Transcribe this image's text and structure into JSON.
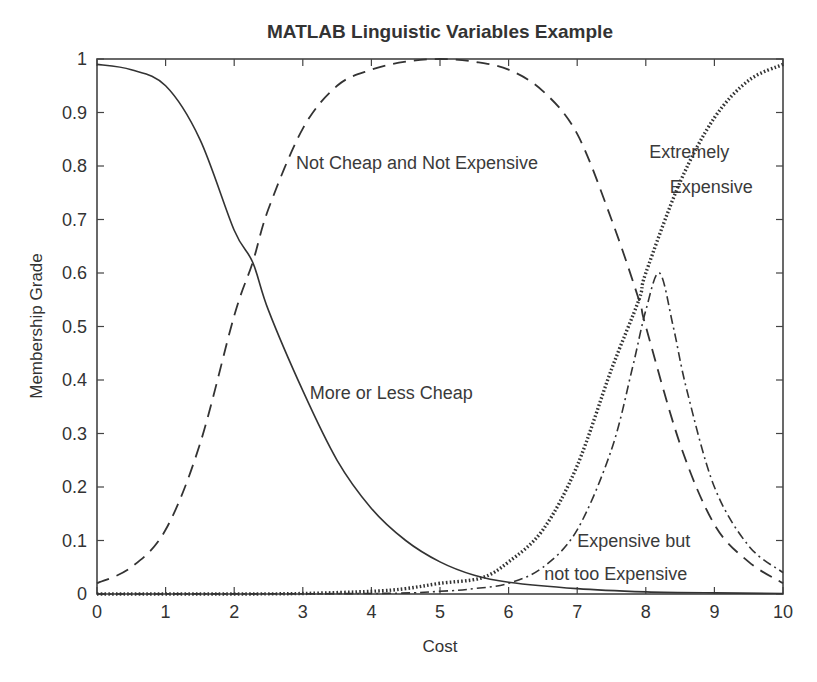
{
  "chart_data": {
    "type": "line",
    "title": "MATLAB Linguistic Variables Example",
    "xlabel": "Cost",
    "ylabel": "Membership Grade",
    "xlim": [
      0,
      10
    ],
    "ylim": [
      0,
      1
    ],
    "grid": false,
    "legend": "none (inline annotations)",
    "x_ticks": [
      0,
      1,
      2,
      3,
      4,
      5,
      6,
      7,
      8,
      9,
      10
    ],
    "x_tick_labels": [
      "0",
      "1",
      "2",
      "3",
      "4",
      "5",
      "6",
      "7",
      "8",
      "9",
      "10"
    ],
    "y_ticks": [
      0,
      0.1,
      0.2,
      0.3,
      0.4,
      0.5,
      0.6,
      0.7,
      0.8,
      0.9,
      1
    ],
    "y_tick_labels": [
      "0",
      "0.1",
      "0.2",
      "0.3",
      "0.4",
      "0.5",
      "0.6",
      "0.7",
      "0.8",
      "0.9",
      "1"
    ],
    "series": [
      {
        "name": "More or Less Cheap",
        "style": "solid",
        "x": [
          0,
          0.5,
          1,
          1.5,
          2,
          2.27,
          2.5,
          3,
          3.5,
          4,
          4.5,
          5,
          5.5,
          6,
          7,
          8,
          9,
          10
        ],
        "values": [
          0.99,
          0.98,
          0.95,
          0.85,
          0.68,
          0.62,
          0.53,
          0.38,
          0.25,
          0.16,
          0.1,
          0.06,
          0.035,
          0.022,
          0.01,
          0.004,
          0.002,
          0.001
        ]
      },
      {
        "name": "Not Cheap and Not Expensive",
        "style": "dashed",
        "x": [
          0,
          0.5,
          1,
          1.5,
          2,
          2.27,
          2.5,
          3,
          3.5,
          4,
          4.5,
          5,
          5.5,
          6,
          6.5,
          7,
          7.5,
          7.9,
          8,
          8.5,
          9,
          9.5,
          10
        ],
        "values": [
          0.02,
          0.05,
          0.12,
          0.28,
          0.52,
          0.62,
          0.72,
          0.87,
          0.95,
          0.98,
          0.995,
          1.0,
          0.995,
          0.98,
          0.94,
          0.86,
          0.7,
          0.55,
          0.5,
          0.28,
          0.13,
          0.06,
          0.02
        ]
      },
      {
        "name": "Extremely Expensive",
        "style": "dotted",
        "x": [
          0,
          2,
          3,
          4,
          4.5,
          5,
          5.6,
          6,
          6.5,
          7,
          7.5,
          7.9,
          8,
          8.5,
          9,
          9.5,
          10
        ],
        "values": [
          0,
          0,
          0.001,
          0.005,
          0.01,
          0.02,
          0.03,
          0.06,
          0.12,
          0.24,
          0.42,
          0.55,
          0.6,
          0.77,
          0.89,
          0.96,
          0.99
        ]
      },
      {
        "name": "Expensive but not too Expensive",
        "style": "dashdot",
        "x": [
          0,
          4,
          5,
          5.5,
          6,
          6.5,
          7,
          7.5,
          7.8,
          8,
          8.2,
          8.4,
          8.6,
          9,
          9.5,
          10
        ],
        "values": [
          0,
          0.001,
          0.005,
          0.01,
          0.02,
          0.05,
          0.12,
          0.27,
          0.42,
          0.53,
          0.6,
          0.5,
          0.38,
          0.2,
          0.09,
          0.04
        ]
      }
    ],
    "annotations": [
      {
        "text": "Not Cheap and Not Expensive",
        "x": 2.9,
        "y": 0.795
      },
      {
        "text": "Extremely",
        "x": 8.05,
        "y": 0.815
      },
      {
        "text": "Expensive",
        "x": 8.35,
        "y": 0.75
      },
      {
        "text": "More or Less Cheap",
        "x": 3.1,
        "y": 0.365
      },
      {
        "text": "Expensive but",
        "x": 7.0,
        "y": 0.087
      },
      {
        "text": "not too Expensive",
        "x": 6.52,
        "y": 0.027
      }
    ]
  },
  "colors": {
    "ink": "#333333",
    "frame": "#444444",
    "background": "#ffffff"
  }
}
